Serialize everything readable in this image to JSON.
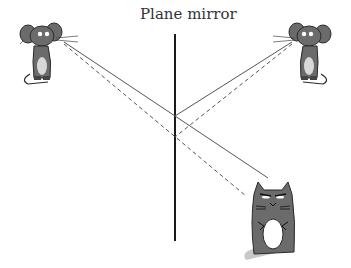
{
  "diagram": {
    "title": "Plane mirror",
    "mirror": {
      "x": 175,
      "y1": 34,
      "y2": 241,
      "color": "#1a1a1a"
    },
    "characters": [
      {
        "name": "left-mouse",
        "x": 35,
        "y": 42
      },
      {
        "name": "right-mouse",
        "x": 305,
        "y": 42
      },
      {
        "name": "cat",
        "x": 282,
        "y": 220
      }
    ],
    "rays": [
      {
        "name": "left-mouse-to-mirror-solid",
        "style": "solid",
        "from": [
          64,
          42
        ],
        "to": [
          175,
          116
        ]
      },
      {
        "name": "mirror-to-cat-solid",
        "style": "solid",
        "from": [
          175,
          116
        ],
        "to": [
          268,
          178
        ]
      },
      {
        "name": "right-mouse-to-mirror-solid",
        "style": "solid",
        "from": [
          292,
          42
        ],
        "to": [
          175,
          116
        ]
      },
      {
        "name": "left-mouse-to-cat-dashed",
        "style": "dashed",
        "from": [
          64,
          44
        ],
        "to": [
          246,
          196
        ]
      },
      {
        "name": "right-mouse-to-mirror-dashed",
        "style": "dashed",
        "from": [
          292,
          44
        ],
        "to": [
          175,
          137
        ]
      }
    ],
    "colors": {
      "ray": "#555555",
      "creature": "#6b6b6b",
      "belly": "#ffffff",
      "outline": "#2a2a2a"
    }
  }
}
